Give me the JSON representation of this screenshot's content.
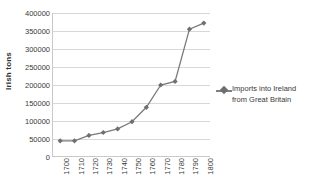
{
  "chart_data": {
    "type": "line",
    "title": "",
    "xlabel": "",
    "ylabel": "Irish tons",
    "categories": [
      "1700",
      "1710",
      "1720",
      "1730",
      "1740",
      "1750",
      "1760",
      "1770",
      "1780",
      "1790",
      "1800"
    ],
    "series": [
      {
        "name": "Imports into Ireland from Great Britain",
        "values": [
          45000,
          45000,
          60000,
          68000,
          78000,
          98000,
          138000,
          200000,
          210000,
          355000,
          372000
        ]
      }
    ],
    "ylim": [
      0,
      400000
    ],
    "y_ticks": [
      "0",
      "50000",
      "100000",
      "150000",
      "200000",
      "250000",
      "300000",
      "350000",
      "400000"
    ],
    "y_tick_values": [
      0,
      50000,
      100000,
      150000,
      200000,
      250000,
      300000,
      350000,
      400000
    ],
    "grid": "horizontal",
    "legend_position": "right",
    "marker": "diamond",
    "series_color": "#7a7a7a",
    "gridline_color": "#d8d8d8",
    "axis_color": "#c9c9c9"
  },
  "legend": {
    "entries": [
      {
        "label_line1": "Imports into Ireland",
        "label_line2": "from Great Britain"
      }
    ]
  }
}
